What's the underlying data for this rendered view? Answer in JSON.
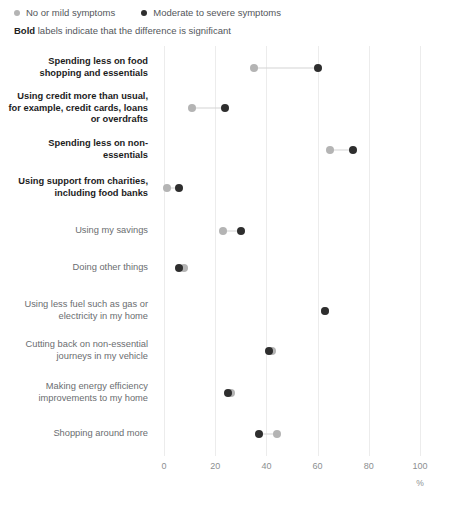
{
  "legend": {
    "items": [
      {
        "label": "No or mild symptoms",
        "color": "#b4b4b4",
        "icon": "dot-icon"
      },
      {
        "label": "Moderate to severe symptoms",
        "color": "#2e2e2e",
        "icon": "dot-icon"
      }
    ]
  },
  "note": {
    "bold_word": "Bold",
    "rest": " labels indicate that the difference is significant"
  },
  "axis": {
    "unit": "%",
    "ticks": [
      "0",
      "20",
      "40",
      "60",
      "80",
      "100"
    ]
  },
  "chart_data": {
    "type": "scatter",
    "title": "",
    "subtitle": "",
    "xlabel": "%",
    "ylabel": "",
    "xlim": [
      0,
      100
    ],
    "xticks": [
      0,
      20,
      40,
      60,
      80,
      100
    ],
    "grid": true,
    "legend_position": "top-left",
    "orientation": "horizontal-dumbbell",
    "series": [
      {
        "name": "No or mild symptoms",
        "color": "#b4b4b4",
        "values": [
          35,
          11,
          65,
          1,
          23,
          8,
          63,
          42,
          26,
          44
        ]
      },
      {
        "name": "Moderate to severe symptoms",
        "color": "#2e2e2e",
        "values": [
          60,
          24,
          74,
          6,
          30,
          6,
          63,
          41,
          25,
          37
        ]
      }
    ],
    "categories": [
      "Spending less on food shopping and essentials",
      "Using credit more than usual, for example, credit cards, loans or overdrafts",
      "Spending less on non-essentials",
      "Using support from charities, including food banks",
      "Using my savings",
      "Doing other things",
      "Using less fuel such as gas or electricity in my home",
      "Cutting back on non-essential journeys in my vehicle",
      "Making energy efficiency improvements to my home",
      "Shopping around more"
    ],
    "rows": [
      {
        "label": "Spending less on food shopping and essentials",
        "significant": true,
        "mild": 35,
        "severe": 60
      },
      {
        "label": "Using credit more than usual, for example, credit cards, loans or overdrafts",
        "significant": true,
        "mild": 11,
        "severe": 24
      },
      {
        "label": "Spending less on non-essentials",
        "significant": true,
        "mild": 65,
        "severe": 74
      },
      {
        "label": "Using support from charities, including food banks",
        "significant": true,
        "mild": 1,
        "severe": 6
      },
      {
        "label": "Using my savings",
        "significant": false,
        "mild": 23,
        "severe": 30
      },
      {
        "label": "Doing other things",
        "significant": false,
        "mild": 8,
        "severe": 6
      },
      {
        "label": "Using less fuel such as gas or electricity in my home",
        "significant": false,
        "mild": 63,
        "severe": 63
      },
      {
        "label": "Cutting back on non-essential journeys in my vehicle",
        "significant": false,
        "mild": 42,
        "severe": 41
      },
      {
        "label": "Making energy efficiency improvements to my home",
        "significant": false,
        "mild": 26,
        "severe": 25
      },
      {
        "label": "Shopping around more",
        "significant": false,
        "mild": 44,
        "severe": 37
      }
    ]
  }
}
